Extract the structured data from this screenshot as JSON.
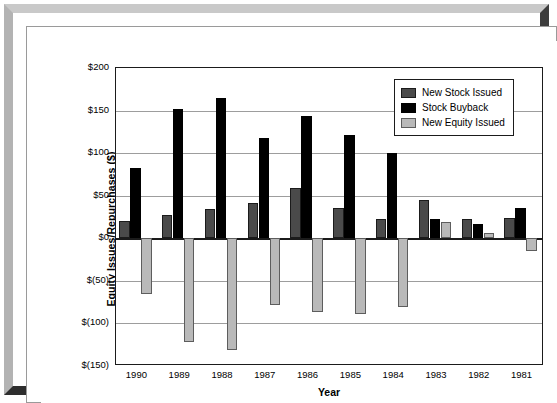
{
  "chart_data": {
    "type": "bar",
    "title": "",
    "xlabel": "Year",
    "ylabel": "Equity Issues/Repurchases ($)",
    "categories": [
      "1990",
      "1989",
      "1988",
      "1987",
      "1986",
      "1985",
      "1984",
      "1983",
      "1982",
      "1981"
    ],
    "series": [
      {
        "name": "New Stock Issued",
        "color": "#4a4a4a",
        "values": [
          20,
          27,
          34,
          42,
          59,
          36,
          23,
          45,
          23,
          24
        ]
      },
      {
        "name": "Stock Buyback",
        "color": "#000000",
        "values": [
          83,
          152,
          165,
          118,
          144,
          121,
          100,
          23,
          17,
          36
        ]
      },
      {
        "name": "New Equity Issued",
        "color": "#b9b9b9",
        "values": [
          -65,
          -122,
          -131,
          -78,
          -87,
          -89,
          -81,
          19,
          6,
          -15
        ]
      }
    ],
    "ylim": [
      -150,
      200
    ],
    "yticks": [
      200,
      150,
      100,
      50,
      0,
      -50,
      -100,
      -150
    ],
    "ytick_labels": [
      "$200",
      "$150",
      "$100",
      "$50",
      "$0",
      "$(50)",
      "$(100)",
      "$(150)"
    ],
    "grid": true,
    "legend_position": "top-right"
  },
  "frame": {
    "style_name": "beveled-picture-frame"
  }
}
